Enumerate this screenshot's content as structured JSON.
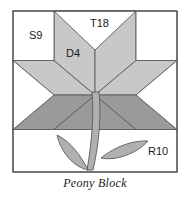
{
  "figure": {
    "caption": "Peony Block"
  },
  "colors": {
    "background": "#ffffff",
    "outline": "#4a4a4a",
    "light_gray": "#c8c8c8",
    "dark_gray": "#9a9a9a",
    "leaf_gray": "#b0b0b0",
    "white_patch": "#ffffff",
    "text": "#1a1a1a"
  },
  "labels": {
    "square": "S9",
    "triangle": "T18",
    "diamond": "D4",
    "rectangle": "R10"
  },
  "label_positions": {
    "square": {
      "x": 29,
      "y": 39
    },
    "triangle": {
      "x": 90,
      "y": 27
    },
    "diamond": {
      "x": 66,
      "y": 57
    },
    "rectangle": {
      "x": 148,
      "y": 155
    }
  },
  "block": {
    "frame": {
      "x": 13,
      "y": 11,
      "width": 164,
      "height": 161
    },
    "grid_lines_y": [
      60.5,
      129.5
    ],
    "center": {
      "x": 95,
      "y": 95
    },
    "star_points": 8,
    "description": "Eight-pointed LeMoyne star with four light diamonds above, four dark diamonds below, white corner squares, white side triangles, and an appliqued stem with two leaves in the lower band."
  }
}
